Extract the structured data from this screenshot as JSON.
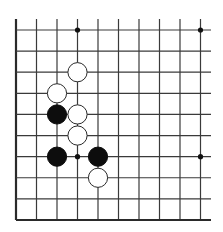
{
  "game": "Go",
  "board": {
    "visible_columns": 10,
    "visible_rows": 10,
    "edges_visible": [
      "left",
      "bottom"
    ],
    "cropped_sides": [
      "top",
      "right"
    ],
    "origin_px": [
      16,
      30
    ],
    "spacing_px": [
      20.5,
      21.11
    ],
    "line_color": "#3a3a3a",
    "background": "#ffffff"
  },
  "star_points": [
    {
      "col": 3,
      "row": 0
    },
    {
      "col": 9,
      "row": 0
    },
    {
      "col": 3,
      "row": 6
    },
    {
      "col": 9,
      "row": 6
    }
  ],
  "stones": [
    {
      "color": "white",
      "col": 3,
      "row": 2
    },
    {
      "color": "white",
      "col": 2,
      "row": 3
    },
    {
      "color": "black",
      "col": 2,
      "row": 4
    },
    {
      "color": "white",
      "col": 3,
      "row": 4
    },
    {
      "color": "white",
      "col": 3,
      "row": 5
    },
    {
      "color": "black",
      "col": 2,
      "row": 6
    },
    {
      "color": "black",
      "col": 4,
      "row": 6
    },
    {
      "color": "white",
      "col": 4,
      "row": 7
    }
  ],
  "colors": {
    "black_stone": "#0d0d0d",
    "white_stone": "#ffffff",
    "white_stone_outline": "#2a2a2a"
  }
}
